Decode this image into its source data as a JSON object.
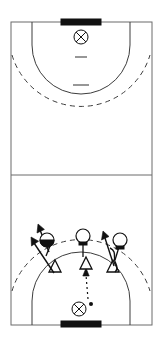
{
  "diagram": {
    "sport": "handball",
    "orientation": "vertical-full-court",
    "colors": {
      "background": "#ffffff",
      "court_line": "#6b6b6b",
      "area_arc": "#3d3d3d",
      "player_stroke": "#111111",
      "goal_fill": "#111111"
    }
  },
  "court": {
    "label": "full-court",
    "left": 11,
    "right": 152,
    "top": 22,
    "bottom": 325,
    "center_line_y": 175,
    "width_px": 141,
    "height_px": 303
  },
  "goals": [
    {
      "name": "top-goal",
      "x": 61,
      "y": 20,
      "width": 40,
      "height": 6,
      "label": "Goal (top)"
    },
    {
      "name": "bottom-goal",
      "x": 61,
      "y": 321,
      "width": 40,
      "height": 6,
      "label": "Goal (bottom)"
    }
  ],
  "goalkeepers": [
    {
      "name": "top-goalkeeper",
      "cx": 81,
      "cy": 37,
      "r": 7,
      "label": "GK"
    },
    {
      "name": "bottom-goalkeeper",
      "cx": 79,
      "cy": 309,
      "r": 7,
      "label": "GK"
    }
  ],
  "ball": {
    "name": "ball",
    "cx": 92,
    "cy": 305,
    "r": 2,
    "label": "Ball"
  },
  "areas": {
    "six_meter_top": {
      "label": "6m goal area line (top)",
      "style": "solid"
    },
    "nine_meter_top": {
      "label": "9m free throw line (top)",
      "style": "dashed"
    },
    "six_meter_bottom": {
      "label": "6m goal area line (bottom)",
      "style": "solid"
    },
    "nine_meter_bottom": {
      "label": "9m free throw line (bottom)",
      "style": "dashed"
    }
  },
  "marks": [
    {
      "name": "four-meter-line-top",
      "label": "4m goalkeeper line",
      "x1": 75,
      "x2": 87,
      "y": 57
    },
    {
      "name": "seven-meter-line-top",
      "label": "7m penalty line",
      "x1": 73,
      "x2": 89,
      "y": 85
    }
  ],
  "attackers": [
    {
      "name": "attacker-left",
      "label": "Attacker left (back)",
      "cx": 46,
      "cy": 240,
      "r": 7,
      "variant": "half-filled",
      "stem_dx": -4,
      "stem_dy": 10
    },
    {
      "name": "attacker-center",
      "label": "Attacker centre back",
      "cx": 83,
      "cy": 236,
      "r": 7,
      "variant": "open",
      "stem_dx": 0,
      "stem_dy": 14
    },
    {
      "name": "attacker-right",
      "label": "Attacker right (back)",
      "cx": 119,
      "cy": 240,
      "r": 7,
      "variant": "open",
      "stem_dx": -4,
      "stem_dy": 14
    }
  ],
  "defenders": [
    {
      "name": "defender-left",
      "label": "Defender left",
      "cx": 55,
      "cy": 268,
      "size": 8
    },
    {
      "name": "defender-center",
      "label": "Defender centre",
      "cx": 86,
      "cy": 265,
      "size": 8
    },
    {
      "name": "defender-right",
      "label": "Defender right",
      "cx": 113,
      "cy": 268,
      "size": 8
    }
  ],
  "movements": [
    {
      "name": "movement-arrow-left-outer",
      "label": "Left defender runs out wide",
      "from": [
        54,
        272
      ],
      "to": [
        33,
        242
      ]
    },
    {
      "name": "movement-arrow-left-inner",
      "label": "Left attacker cuts up",
      "from": [
        49,
        250
      ],
      "to": [
        39,
        227
      ]
    },
    {
      "name": "movement-arrow-right",
      "label": "Right defender steps out",
      "from": [
        114,
        268
      ],
      "to": [
        103,
        234
      ]
    }
  ],
  "curves": [
    {
      "name": "curve-right-attacker",
      "label": "Right attacker curved run"
    }
  ],
  "passes": [
    {
      "name": "pass-goalkeeper-to-centre",
      "label": "Pass from goalkeeper to centre defender",
      "from": [
        87,
        300
      ],
      "to": [
        86,
        272
      ]
    }
  ],
  "legend": {
    "attacker": "Attacker (circle)",
    "defender": "Defender (triangle)",
    "goalkeeper": "Goalkeeper (crossed circle)",
    "movement": "Movement (solid arrow)",
    "pass": "Pass (dotted arrow)"
  }
}
